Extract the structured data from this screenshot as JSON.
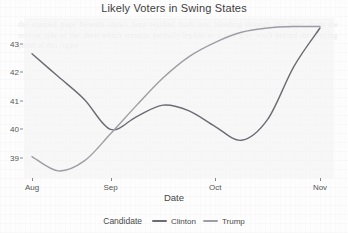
{
  "chart_data": {
    "type": "line",
    "title": "Likely Voters in Swing States",
    "xlabel": "Date",
    "ylabel": "",
    "xticks": [
      "Aug",
      "Sep",
      "Oct",
      "Nov"
    ],
    "yticks": [
      "39",
      "40",
      "41",
      "42",
      "43"
    ],
    "ylim": [
      38.3,
      43.9
    ],
    "xlim": [
      "Aug",
      "Nov+"
    ],
    "grid": false,
    "legend": {
      "title": "Candidate",
      "position": "bottom",
      "entries": [
        {
          "name": "Clinton",
          "color": "#6b6b73"
        },
        {
          "name": "Trump",
          "color": "#9d9da4"
        }
      ]
    },
    "series": [
      {
        "name": "Clinton",
        "color": "#6b6b73",
        "x": [
          "Aug",
          "Aug+8d",
          "Aug+16d",
          "Sep",
          "Sep+9d",
          "Sep+18d",
          "Sep+26d",
          "Oct",
          "Oct+8d",
          "Oct+17d",
          "Oct+25d",
          "Nov"
        ],
        "values": [
          42.65,
          41.85,
          41.05,
          40.0,
          40.45,
          40.85,
          40.65,
          40.1,
          39.62,
          40.35,
          42.2,
          43.55
        ]
      },
      {
        "name": "Trump",
        "color": "#9d9da4",
        "x": [
          "Aug",
          "Aug+8d",
          "Aug+16d",
          "Sep",
          "Sep+9d",
          "Sep+18d",
          "Sep+26d",
          "Oct",
          "Oct+8d",
          "Oct+17d",
          "Oct+25d",
          "Nov"
        ],
        "values": [
          39.05,
          38.55,
          38.9,
          39.85,
          40.85,
          41.8,
          42.55,
          43.05,
          43.4,
          43.55,
          43.6,
          43.6
        ]
      }
    ]
  },
  "ghost_text": "the scanned page beneath shows faint residual body text bleeding through the paper from the reverse side of the sheet which remains partially legible as a soft grey wash behind the plotting panel of this figure"
}
